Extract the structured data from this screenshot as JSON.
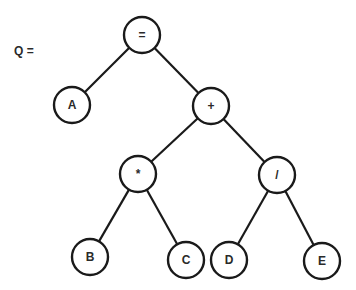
{
  "title": "Q =",
  "tree": {
    "nodes": [
      {
        "id": "eq",
        "label": "=",
        "x": 142,
        "y": 35
      },
      {
        "id": "A",
        "label": "A",
        "x": 72,
        "y": 105
      },
      {
        "id": "plus",
        "label": "+",
        "x": 211,
        "y": 106
      },
      {
        "id": "mul",
        "label": "*",
        "x": 138,
        "y": 174
      },
      {
        "id": "div",
        "label": "/",
        "x": 277,
        "y": 175
      },
      {
        "id": "B",
        "label": "B",
        "x": 90,
        "y": 257
      },
      {
        "id": "C",
        "label": "C",
        "x": 186,
        "y": 260
      },
      {
        "id": "D",
        "label": "D",
        "x": 229,
        "y": 260
      },
      {
        "id": "E",
        "label": "E",
        "x": 322,
        "y": 261
      }
    ],
    "edges": [
      [
        "eq",
        "A"
      ],
      [
        "eq",
        "plus"
      ],
      [
        "plus",
        "mul"
      ],
      [
        "plus",
        "div"
      ],
      [
        "mul",
        "B"
      ],
      [
        "mul",
        "C"
      ],
      [
        "div",
        "D"
      ],
      [
        "div",
        "E"
      ]
    ],
    "node_radius": 18,
    "stroke_color": "#1a1a1a"
  }
}
